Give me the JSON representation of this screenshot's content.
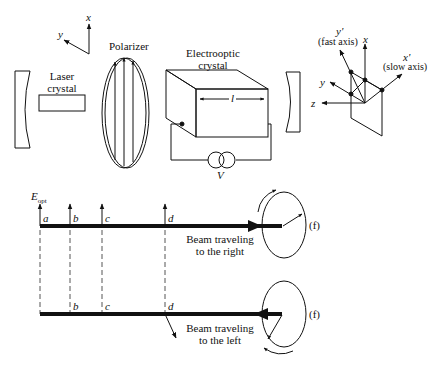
{
  "diagram": {
    "laser_setup": {
      "coord_axes": {
        "x": "x",
        "y": "y"
      },
      "laser_crystal_label_line1": "Laser",
      "laser_crystal_label_line2": "crystal",
      "polarizer_label": "Polarizer",
      "electrooptic_label_line1": "Electrooptic",
      "electrooptic_label_line2": "crystal",
      "length_label": "l",
      "voltage_label": "V"
    },
    "axes_inset": {
      "y_prime": "y'",
      "fast_axis": "(fast axis)",
      "x": "x",
      "x_prime": "x'",
      "slow_axis": "(slow axis)",
      "y": "y",
      "z": "z"
    },
    "beam_right": {
      "e_field_label": "E",
      "e_field_subscript": "opt",
      "points": [
        "a",
        "b",
        "c",
        "d"
      ],
      "caption_line1": "Beam traveling",
      "caption_line2": "to the right",
      "position_label": "(f)"
    },
    "beam_left": {
      "points": [
        "b",
        "c",
        "d"
      ],
      "caption_line1": "Beam traveling",
      "caption_line2": "to the left",
      "position_label": "(f)"
    }
  }
}
